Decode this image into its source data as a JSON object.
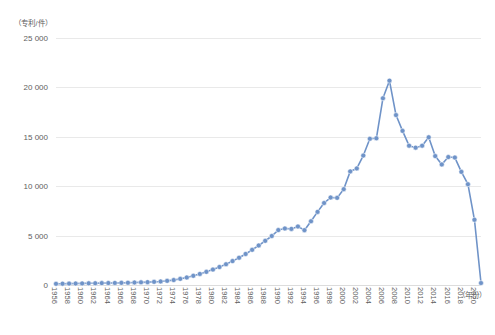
{
  "chart_data": {
    "type": "line",
    "title": "",
    "subtitle": "",
    "xlabel": "（年份）",
    "ylabel": "（专利/件）",
    "grid": true,
    "legend": null,
    "legend_position": "none",
    "accent_color": "#6f93c8",
    "marker_color": "#6f93c8",
    "gridline_color": "#e9e9e9",
    "text_color": "#5e5e5e",
    "xlim": [
      1956,
      2021
    ],
    "ylim": [
      0,
      25000
    ],
    "yticks": [
      0,
      5000,
      10000,
      15000,
      20000,
      25000
    ],
    "ytick_labels": [
      "0",
      "5 000",
      "10 000",
      "15 000",
      "20 000",
      "25 000"
    ],
    "xtick_labels": [
      "1956",
      "1958",
      "1960",
      "1962",
      "1964",
      "1966",
      "1968",
      "1970",
      "1972",
      "1974",
      "1976",
      "1978",
      "1980",
      "1982",
      "1984",
      "1986",
      "1988",
      "1990",
      "1992",
      "1994",
      "1996",
      "1998",
      "2000",
      "2002",
      "2004",
      "2006",
      "2008",
      "2010",
      "2012",
      "2014",
      "2016",
      "2018",
      "2020"
    ],
    "x": [
      1956,
      1957,
      1958,
      1959,
      1960,
      1961,
      1962,
      1963,
      1964,
      1965,
      1966,
      1967,
      1968,
      1969,
      1970,
      1971,
      1972,
      1973,
      1974,
      1975,
      1976,
      1977,
      1978,
      1979,
      1980,
      1981,
      1982,
      1983,
      1984,
      1985,
      1986,
      1987,
      1988,
      1989,
      1990,
      1991,
      1992,
      1993,
      1994,
      1995,
      1996,
      1997,
      1998,
      1999,
      2000,
      2001,
      2002,
      2003,
      2004,
      2005,
      2006,
      2007,
      2008,
      2009,
      2010,
      2011,
      2012,
      2013,
      2014,
      2015,
      2016,
      2017,
      2018,
      2019,
      2020,
      2021
    ],
    "values": [
      120,
      130,
      140,
      150,
      160,
      170,
      180,
      190,
      200,
      210,
      220,
      230,
      250,
      270,
      290,
      320,
      360,
      420,
      500,
      620,
      760,
      930,
      1120,
      1330,
      1560,
      1820,
      2100,
      2420,
      2760,
      3140,
      3560,
      4000,
      4470,
      4960,
      5560,
      5720,
      5680,
      5920,
      5550,
      6450,
      7400,
      8300,
      8850,
      8820,
      9700,
      11500,
      11800,
      13100,
      14800,
      14850,
      18900,
      20680,
      17200,
      15600,
      14100,
      13900,
      14100,
      14950,
      13050,
      12200,
      12950,
      12900,
      11450,
      10200,
      6600,
      200
    ]
  }
}
